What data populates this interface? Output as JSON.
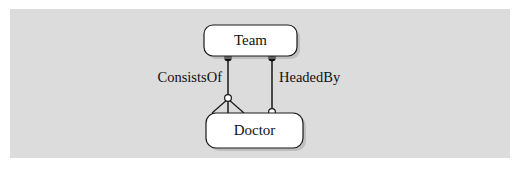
{
  "diagram": {
    "type": "uml-class-diagram",
    "background_color": "#dcdcdc",
    "page_color": "#ffffff",
    "line_color": "#1a1a1a",
    "node_fill": "#ffffff",
    "nodes": [
      {
        "id": "team",
        "label": "Team",
        "shape": "rounded-rectangle",
        "x": 204,
        "y": 25,
        "width": 93,
        "height": 31
      },
      {
        "id": "doctor",
        "label": "Doctor",
        "shape": "rounded-rectangle",
        "x": 206,
        "y": 113,
        "width": 97,
        "height": 35
      }
    ],
    "edges": [
      {
        "id": "consists-of",
        "label": "ConsistsOf",
        "from": "team",
        "to": "doctor",
        "from_marker": "filled-circle",
        "to_marker": "hollow-circle",
        "has_generalization_fork": true,
        "x": 228,
        "from_y": 57,
        "to_y": 98,
        "label_x": 222,
        "label_y": 79
      },
      {
        "id": "headed-by",
        "label": "HeadedBy",
        "from": "team",
        "to": "doctor",
        "from_marker": "filled-circle",
        "to_marker": "hollow-circle",
        "has_generalization_fork": false,
        "x": 272,
        "from_y": 57,
        "to_y": 112,
        "label_x": 279,
        "label_y": 79
      }
    ]
  }
}
